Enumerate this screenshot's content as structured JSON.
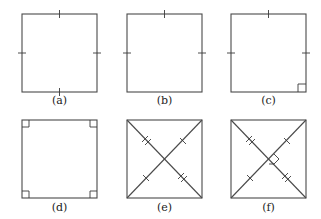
{
  "figures": [
    {
      "id": "a",
      "label": "(a)",
      "description": "Square with all four sides marked congruent (single tick on each side)"
    },
    {
      "id": "b",
      "label": "(b)",
      "description": "Square with top, left and right sides marked congruent (single tick)"
    },
    {
      "id": "c",
      "label": "(c)",
      "description": "Square with top, left and right sides marked congruent and a right angle at bottom-right corner"
    },
    {
      "id": "d",
      "label": "(d)",
      "description": "Square with right-angle marks at all four corners"
    },
    {
      "id": "e",
      "label": "(e)",
      "description": "Square with diagonals; diagonal halves marked with single and double ticks"
    },
    {
      "id": "f",
      "label": "(f)",
      "description": "Square with diagonals; diagonal halves marked with single and double ticks and a right angle at the intersection"
    }
  ],
  "colors": {
    "stroke": "#4a4a4a",
    "background": "#ffffff"
  }
}
